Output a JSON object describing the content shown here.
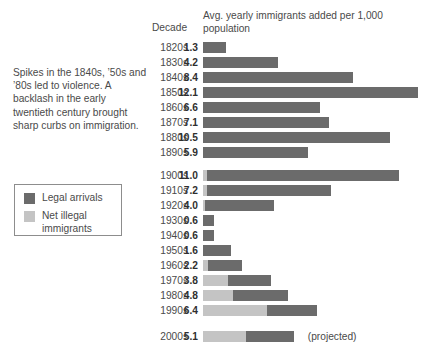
{
  "caption": "Spikes in the 1840s, ’50s and ’80s  led to violence. A backlash in the early twentieth century brought sharp curbs on immigration.",
  "header": {
    "decade_label": "Decade",
    "measure_label": "Avg. yearly immigrants added per 1,000 population"
  },
  "legend": {
    "items": [
      {
        "label": "Legal arrivals",
        "color": "#6b6b6b"
      },
      {
        "label": "Net illegal immigrants",
        "color": "#c4c4c4"
      }
    ]
  },
  "colors": {
    "legal": "#6b6b6b",
    "illegal": "#c4c4c4",
    "text": "#4a4a4a"
  },
  "chart_data": {
    "type": "bar",
    "title": "Avg. yearly immigrants added per 1,000 population",
    "xlabel": "Avg. yearly immigrants added per 1,000 population",
    "ylabel": "Decade",
    "orientation": "horizontal",
    "stacked": true,
    "grid": false,
    "legend_position": "left",
    "xlim": [
      0,
      12.1
    ],
    "px_per_unit": 17.8,
    "categories": [
      "1820s",
      "1830s",
      "1840s",
      "1850s",
      "1860s",
      "1870s",
      "1880s",
      "1890s",
      "1900s",
      "1910s",
      "1920s",
      "1930s",
      "1940s",
      "1950s",
      "1960s",
      "1970s",
      "1980s",
      "1990s",
      "2000s"
    ],
    "values": [
      1.3,
      4.2,
      8.4,
      12.1,
      6.6,
      7.1,
      10.5,
      5.9,
      11.0,
      7.2,
      4.0,
      0.6,
      0.6,
      1.6,
      2.2,
      3.8,
      4.8,
      6.4,
      5.1
    ],
    "series": [
      {
        "name": "Net illegal immigrants",
        "color": "#c4c4c4",
        "values": [
          0,
          0,
          0,
          0,
          0,
          0,
          0,
          0,
          0.2,
          0.2,
          0.1,
          0,
          0,
          0,
          0.3,
          1.4,
          1.7,
          3.6,
          2.4
        ]
      },
      {
        "name": "Legal arrivals",
        "color": "#6b6b6b",
        "values": [
          1.3,
          4.2,
          8.4,
          12.1,
          6.6,
          7.1,
          10.5,
          5.9,
          10.8,
          7.0,
          3.9,
          0.6,
          0.6,
          1.6,
          1.9,
          2.4,
          3.1,
          2.8,
          2.7
        ]
      }
    ],
    "rows": [
      {
        "decade": "1820s",
        "value": "1.3",
        "total": 1.3,
        "illegal": 0,
        "legal": 1.3,
        "top": 41,
        "note": ""
      },
      {
        "decade": "1830s",
        "value": "4.2",
        "total": 4.2,
        "illegal": 0,
        "legal": 4.2,
        "top": 56,
        "note": ""
      },
      {
        "decade": "1840s",
        "value": "8.4",
        "total": 8.4,
        "illegal": 0,
        "legal": 8.4,
        "top": 71,
        "note": ""
      },
      {
        "decade": "1850s",
        "value": "12.1",
        "total": 12.1,
        "illegal": 0,
        "legal": 12.1,
        "top": 86,
        "note": ""
      },
      {
        "decade": "1860s",
        "value": "6.6",
        "total": 6.6,
        "illegal": 0,
        "legal": 6.6,
        "top": 101,
        "note": ""
      },
      {
        "decade": "1870s",
        "value": "7.1",
        "total": 7.1,
        "illegal": 0,
        "legal": 7.1,
        "top": 116,
        "note": ""
      },
      {
        "decade": "1880s",
        "value": "10.5",
        "total": 10.5,
        "illegal": 0,
        "legal": 10.5,
        "top": 131,
        "note": ""
      },
      {
        "decade": "1890s",
        "value": "5.9",
        "total": 5.9,
        "illegal": 0,
        "legal": 5.9,
        "top": 146,
        "note": ""
      },
      {
        "decade": "1900s",
        "value": "11.0",
        "total": 11.0,
        "illegal": 0.2,
        "legal": 10.8,
        "top": 169,
        "note": ""
      },
      {
        "decade": "1910s",
        "value": "7.2",
        "total": 7.2,
        "illegal": 0.2,
        "legal": 7.0,
        "top": 184,
        "note": ""
      },
      {
        "decade": "1920s",
        "value": "4.0",
        "total": 4.0,
        "illegal": 0.1,
        "legal": 3.9,
        "top": 199,
        "note": ""
      },
      {
        "decade": "1930s",
        "value": "0.6",
        "total": 0.6,
        "illegal": 0,
        "legal": 0.6,
        "top": 214,
        "note": ""
      },
      {
        "decade": "1940s",
        "value": "0.6",
        "total": 0.6,
        "illegal": 0,
        "legal": 0.6,
        "top": 229,
        "note": ""
      },
      {
        "decade": "1950s",
        "value": "1.6",
        "total": 1.6,
        "illegal": 0,
        "legal": 1.6,
        "top": 244,
        "note": ""
      },
      {
        "decade": "1960s",
        "value": "2.2",
        "total": 2.2,
        "illegal": 0.3,
        "legal": 1.9,
        "top": 259,
        "note": ""
      },
      {
        "decade": "1970s",
        "value": "3.8",
        "total": 3.8,
        "illegal": 1.4,
        "legal": 2.4,
        "top": 274,
        "note": ""
      },
      {
        "decade": "1980s",
        "value": "4.8",
        "total": 4.8,
        "illegal": 1.7,
        "legal": 3.1,
        "top": 289,
        "note": ""
      },
      {
        "decade": "1990s",
        "value": "6.4",
        "total": 6.4,
        "illegal": 3.6,
        "legal": 2.8,
        "top": 304,
        "note": ""
      },
      {
        "decade": "2000s",
        "value": "5.1",
        "total": 5.1,
        "illegal": 2.4,
        "legal": 2.7,
        "top": 330,
        "note": "(projected)"
      }
    ]
  }
}
